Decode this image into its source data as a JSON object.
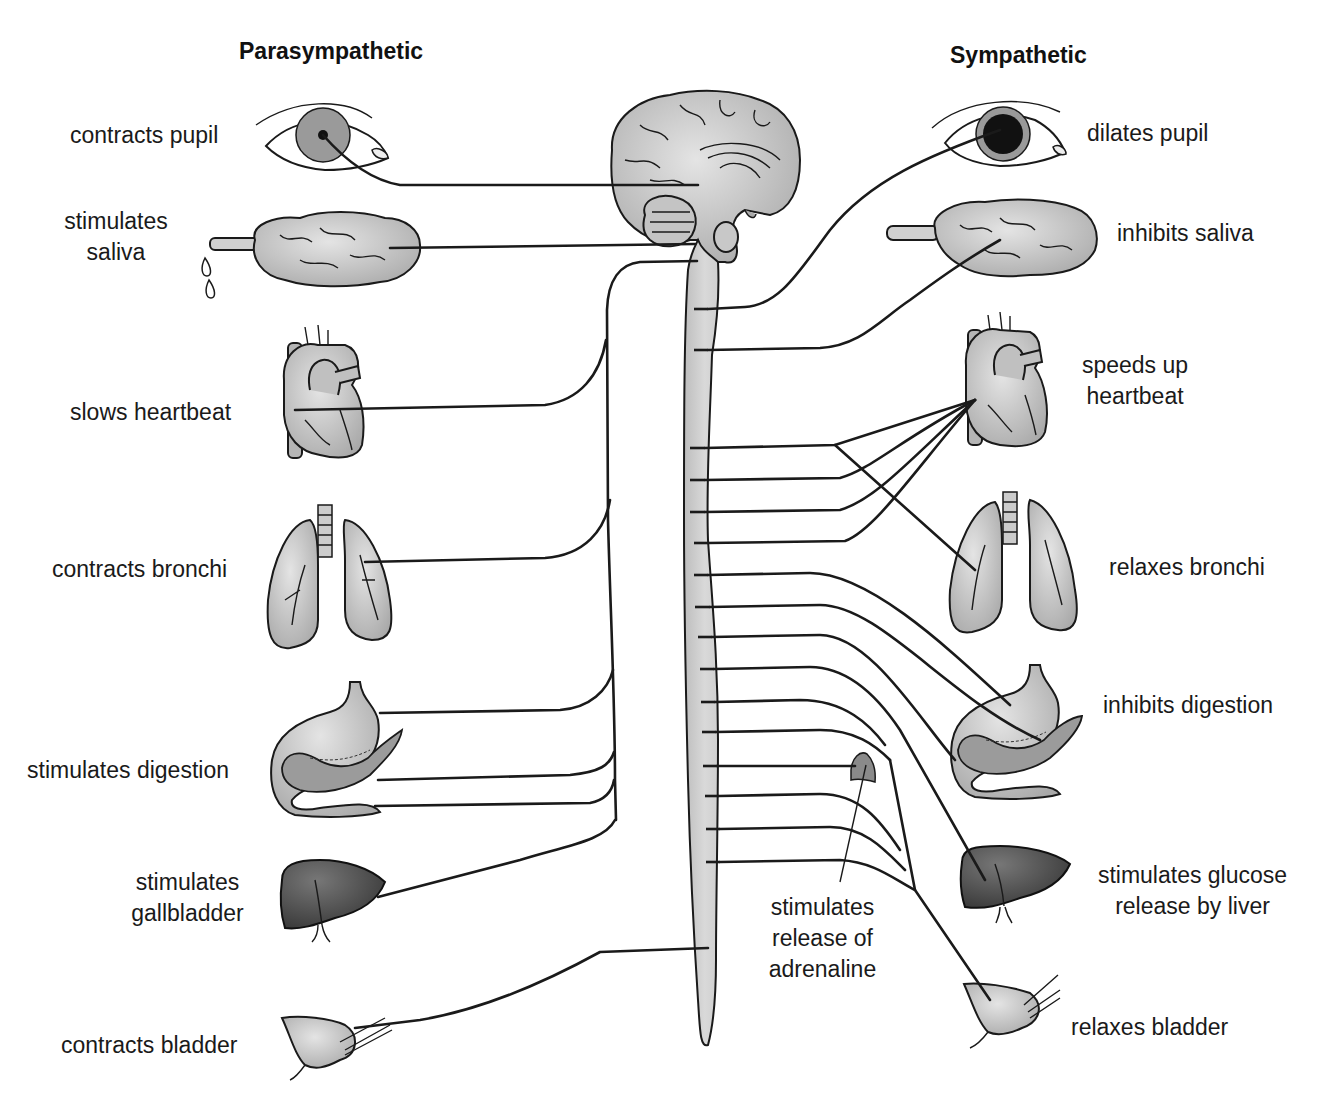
{
  "headers": {
    "parasympathetic": "Parasympathetic",
    "sympathetic": "Sympathetic"
  },
  "parasympathetic": {
    "items": [
      {
        "organ": "eye",
        "label": "contracts pupil"
      },
      {
        "organ": "salivary-gland",
        "label": "stimulates saliva"
      },
      {
        "organ": "heart",
        "label": "slows heartbeat"
      },
      {
        "organ": "lungs",
        "label": "contracts bronchi"
      },
      {
        "organ": "stomach-pancreas",
        "label": "stimulates digestion"
      },
      {
        "organ": "liver-gallbladder",
        "label": "stimulates gallbladder"
      },
      {
        "organ": "bladder",
        "label": "contracts bladder"
      }
    ],
    "label_lines": {
      "saliva": [
        "stimulates",
        "saliva"
      ],
      "gallbladder": [
        "stimulates",
        "gallbladder"
      ]
    }
  },
  "sympathetic": {
    "items": [
      {
        "organ": "eye",
        "label": "dilates pupil"
      },
      {
        "organ": "salivary-gland",
        "label": "inhibits saliva"
      },
      {
        "organ": "heart",
        "label": "speeds up heartbeat"
      },
      {
        "organ": "lungs",
        "label": "relaxes bronchi"
      },
      {
        "organ": "stomach-pancreas",
        "label": "inhibits digestion"
      },
      {
        "organ": "adrenal-gland",
        "label": "stimulates release of adrenaline"
      },
      {
        "organ": "liver",
        "label": "stimulates glucose release by liver"
      },
      {
        "organ": "bladder",
        "label": "relaxes bladder"
      }
    ],
    "label_lines": {
      "heartbeat": [
        "speeds up",
        "heartbeat"
      ],
      "adrenaline": [
        "stimulates",
        "release of",
        "adrenaline"
      ],
      "glucose": [
        "stimulates glucose",
        "release by liver"
      ]
    }
  },
  "central": {
    "structures": [
      "brain",
      "brainstem",
      "spinal-cord"
    ]
  }
}
